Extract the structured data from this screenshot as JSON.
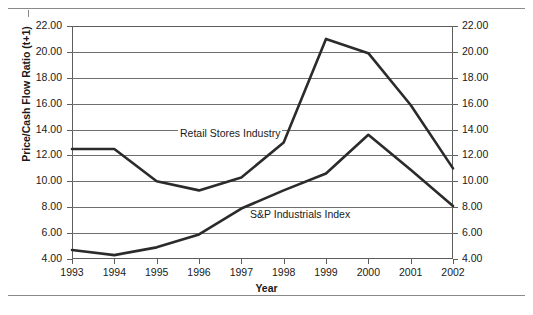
{
  "figure": {
    "has_top_rule": true,
    "has_bottom_rule": true
  },
  "axes": {
    "y_title": "Price/Cash Flow Ratio (t+1)",
    "x_title": "Year",
    "y_tick_labels": [
      "22.00",
      "20.00",
      "18.00",
      "16.00",
      "14.00",
      "12.00",
      "10.00",
      "8.00",
      "6.00",
      "4.00"
    ],
    "y_tick_labels_right": [
      "22.00",
      "20.00",
      "18.00",
      "16.00",
      "14.00",
      "12.00",
      "10.00",
      "8.00",
      "6.00",
      "4.00"
    ],
    "x_tick_labels": [
      "1993",
      "1994",
      "1995",
      "1996",
      "1997",
      "1998",
      "1999",
      "2000",
      "2001",
      "2002"
    ]
  },
  "annotations": {
    "retail": "Retail Stores Industry",
    "sp": "S&P Industrials Index"
  },
  "colors": {
    "series_line": "#2b2b2b",
    "grid": "#6f6f6f",
    "frame": "#5d5d5d",
    "text": "#1a1a1a",
    "background": "#ffffff"
  },
  "chart_data": {
    "type": "line",
    "title": "",
    "xlabel": "Year",
    "ylabel": "Price/Cash Flow Ratio (t+1)",
    "x": [
      1993,
      1994,
      1995,
      1996,
      1997,
      1998,
      1999,
      2000,
      2001,
      2002
    ],
    "categories": [
      "1993",
      "1994",
      "1995",
      "1996",
      "1997",
      "1998",
      "1999",
      "2000",
      "2001",
      "2002"
    ],
    "xlim": [
      1993,
      2002
    ],
    "ylim": [
      4.0,
      22.0
    ],
    "y_ticks": [
      4.0,
      6.0,
      8.0,
      10.0,
      12.0,
      14.0,
      16.0,
      18.0,
      20.0,
      22.0
    ],
    "grid": true,
    "grid_axis": "y",
    "dual_y_axis": true,
    "legend": "inline annotations",
    "legend_position": "inline",
    "series": [
      {
        "name": "Retail Stores Industry",
        "values": [
          12.5,
          12.5,
          10.0,
          9.3,
          10.3,
          13.0,
          21.0,
          19.9,
          15.9,
          11.0
        ]
      },
      {
        "name": "S&P Industrials Index",
        "values": [
          4.7,
          4.3,
          4.9,
          5.9,
          7.9,
          9.3,
          10.6,
          13.6,
          10.9,
          8.1
        ]
      }
    ]
  }
}
